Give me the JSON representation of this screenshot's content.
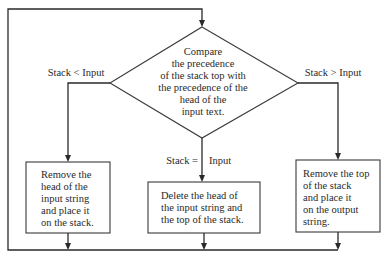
{
  "diagram": {
    "type": "flowchart",
    "decision": {
      "lines": [
        "Compare",
        "the precedence",
        "of the stack top with",
        "the precedence of the",
        "head of the",
        "input text."
      ]
    },
    "branches": [
      {
        "label": "Stack < Input",
        "action_lines": [
          "Remove the",
          "head of the",
          "input string",
          "and place it",
          "on the stack."
        ]
      },
      {
        "label_left": "Stack =",
        "label_right": "Input",
        "action_lines": [
          "Delete the head of",
          "the input string and",
          "the top of the stack."
        ]
      },
      {
        "label": "Stack > Input",
        "action_lines": [
          "Remove the top",
          "of the stack",
          "and place it",
          "on the output",
          "string."
        ]
      }
    ],
    "loop": "All three actions merge and loop back to the decision."
  }
}
